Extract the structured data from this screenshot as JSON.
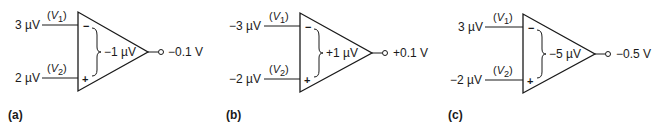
{
  "figure": {
    "panels": [
      {
        "label": "(a)",
        "v1_input": "3 µV",
        "v2_input": "2 µV",
        "v1_name": "V",
        "v1_sub": "1",
        "v2_name": "V",
        "v2_sub": "2",
        "inv_sign": "−",
        "noninv_sign": "+",
        "differential": "−1 µV",
        "output": "−0.1 V"
      },
      {
        "label": "(b)",
        "v1_input": "−3 µV",
        "v2_input": "−2 µV",
        "v1_name": "V",
        "v1_sub": "1",
        "v2_name": "V",
        "v2_sub": "2",
        "inv_sign": "−",
        "noninv_sign": "+",
        "differential": "+1 µV",
        "output": "+0.1 V"
      },
      {
        "label": "(c)",
        "v1_input": "3 µV",
        "v2_input": "−2 µV",
        "v1_name": "V",
        "v1_sub": "1",
        "v2_name": "V",
        "v2_sub": "2",
        "inv_sign": "−",
        "noninv_sign": "+",
        "differential": "−5 µV",
        "output": "−0.5 V"
      }
    ],
    "colors": {
      "line": "#1a1a1a",
      "background": "#ffffff"
    }
  }
}
